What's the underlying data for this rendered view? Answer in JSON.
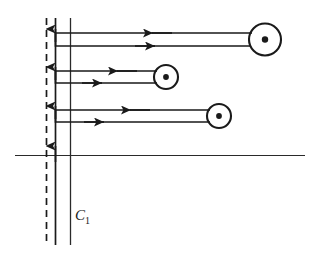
{
  "figure": {
    "background": "#ffffff",
    "ink_color": "#1a1a1a",
    "width": 313,
    "height": 261
  },
  "labels": {
    "contour": "C",
    "contour_sub": "1",
    "contour_full": "C₁",
    "contour_x": 75,
    "contour_y": 207
  },
  "chart_data": {
    "type": "diagram",
    "real_axis": {
      "x1": 15,
      "y1": 155,
      "x2": 305,
      "y2": 155
    },
    "dashed_line": {
      "x": 46,
      "y1": 18,
      "y2": 245,
      "dash": "7 5"
    },
    "contour_vertical": {
      "x": 55,
      "y1": 18,
      "y2": 245,
      "arrow_ys": [
        30,
        68,
        107,
        148
      ]
    },
    "contour_vertical_2": {
      "x": 70,
      "y1": 18,
      "y2": 245
    },
    "loops": [
      {
        "name": "loop-upper",
        "top_y": 33,
        "bottom_y": 46,
        "left_x": 55,
        "pole_x": 265,
        "pole_y": 39.5,
        "pole_r_outer": 16,
        "pole_r_inner": 3.2,
        "arrow_in_x": 155,
        "arrow_out_x": 152
      },
      {
        "name": "loop-middle",
        "top_y": 71,
        "bottom_y": 83,
        "left_x": 55,
        "pole_x": 166,
        "pole_y": 77,
        "pole_r_outer": 12,
        "pole_r_inner": 2.8,
        "arrow_in_x": 118,
        "arrow_out_x": 100
      },
      {
        "name": "loop-lower",
        "top_y": 110,
        "bottom_y": 122,
        "left_x": 55,
        "pole_x": 219,
        "pole_y": 116,
        "pole_r_outer": 12,
        "pole_r_inner": 2.8,
        "arrow_in_x": 131,
        "arrow_out_x": 102
      }
    ],
    "arrow_directions": {
      "vertical": "up",
      "loop_top_line": "left",
      "loop_bottom_line": "right"
    }
  }
}
